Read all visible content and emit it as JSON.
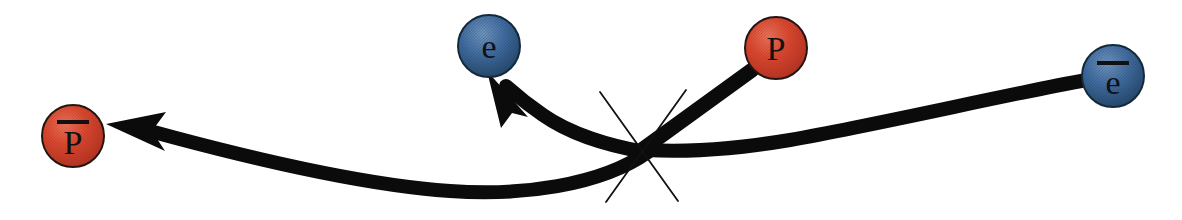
{
  "diagram": {
    "title": "",
    "kind": "particle-interaction-diagram",
    "background_color": "#ffffff",
    "colors": {
      "matter_sphere": "#d2402b",
      "antimatter_sphere_blue": "#40699c",
      "track_black": "#0b0b0b",
      "label_text": "#111111"
    },
    "vertex": {
      "name": "interaction-vertex",
      "x": 638,
      "y": 146,
      "spark_count": 2
    },
    "particles": [
      {
        "id": "antiproton",
        "label": "P",
        "has_overbar": true,
        "color": "#d2402b",
        "type": "red",
        "cx": 73,
        "cy": 136,
        "r": 31,
        "role": "outgoing"
      },
      {
        "id": "electron",
        "label": "e",
        "has_overbar": false,
        "color": "#40699c",
        "type": "blue",
        "cx": 489,
        "cy": 46,
        "r": 31,
        "role": "outgoing"
      },
      {
        "id": "proton",
        "label": "P",
        "has_overbar": false,
        "color": "#d2402b",
        "type": "red",
        "cx": 776,
        "cy": 48,
        "r": 31,
        "role": "incoming"
      },
      {
        "id": "positron",
        "label": "e",
        "has_overbar": true,
        "color": "#40699c",
        "type": "blue",
        "cx": 1113,
        "cy": 76,
        "r": 31,
        "role": "incoming"
      }
    ],
    "tracks": [
      {
        "id": "proton-in-track",
        "from": "proton",
        "to": "interaction-vertex",
        "arrow": false,
        "width": 15
      },
      {
        "id": "positron-in-track",
        "from": "positron",
        "to": "interaction-vertex",
        "arrow": false,
        "width": 14
      },
      {
        "id": "electron-out-track",
        "from": "interaction-vertex",
        "to": "electron",
        "arrow": true,
        "width": 14
      },
      {
        "id": "antiproton-out-track",
        "from": "interaction-vertex",
        "to": "antiproton",
        "arrow": true,
        "width": 14
      }
    ]
  }
}
